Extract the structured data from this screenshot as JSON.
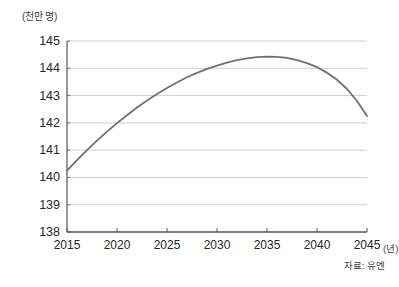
{
  "chart_data": {
    "type": "line",
    "title": "",
    "subtitle": "",
    "ylabel": "(천만 명)",
    "xlabel": "(년)",
    "source_note": "자료: 유엔",
    "grid": true,
    "legend": "none",
    "xlim": [
      2015,
      2045
    ],
    "ylim": [
      138,
      145
    ],
    "x_ticks": [
      2015,
      2020,
      2025,
      2030,
      2035,
      2040,
      2045
    ],
    "x_tick_labels": [
      "2015",
      "2020",
      "2025",
      "2030",
      "2035",
      "2040",
      "2045"
    ],
    "y_ticks": [
      138,
      139,
      140,
      141,
      142,
      143,
      144,
      145
    ],
    "y_tick_labels": [
      "138",
      "139",
      "140",
      "141",
      "142",
      "143",
      "144",
      "145"
    ],
    "series": [
      {
        "name": "인구 추계",
        "color": "#706f72",
        "x": [
          2015,
          2016,
          2017,
          2018,
          2019,
          2020,
          2021,
          2022,
          2023,
          2024,
          2025,
          2026,
          2027,
          2028,
          2029,
          2030,
          2031,
          2032,
          2033,
          2034,
          2035,
          2036,
          2037,
          2038,
          2039,
          2040,
          2041,
          2042,
          2043,
          2044,
          2045
        ],
        "values": [
          140.25,
          140.63,
          141.0,
          141.35,
          141.68,
          141.99,
          142.28,
          142.56,
          142.82,
          143.06,
          143.28,
          143.48,
          143.67,
          143.83,
          143.98,
          144.1,
          144.21,
          144.3,
          144.36,
          144.41,
          144.43,
          144.42,
          144.38,
          144.3,
          144.19,
          144.04,
          143.84,
          143.58,
          143.24,
          142.8,
          142.25
        ]
      }
    ]
  },
  "plot_geometry": {
    "left": 67,
    "right": 367,
    "top": 41,
    "bottom": 232
  }
}
